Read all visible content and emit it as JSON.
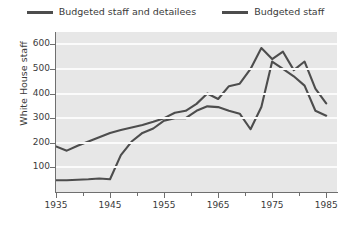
{
  "chart_data": {
    "type": "line",
    "title": "",
    "xlabel": "",
    "ylabel": "White House staff",
    "xlim": [
      1935,
      1987
    ],
    "ylim": [
      0,
      650
    ],
    "grid": true,
    "legend_position": "top-center",
    "x_ticks": [
      1935,
      1945,
      1955,
      1965,
      1975,
      1985
    ],
    "x_ticks_minor": [
      1940,
      1950,
      1960,
      1970,
      1980
    ],
    "y_ticks": [
      100,
      200,
      300,
      400,
      500,
      600
    ],
    "series": [
      {
        "name": "Budgeted staff and detailees",
        "color": "#4d4d4d",
        "x": [
          1935,
          1937,
          1939,
          1941,
          1943,
          1945,
          1947,
          1949,
          1951,
          1953,
          1955,
          1957,
          1959,
          1961,
          1963,
          1965,
          1967,
          1969,
          1971,
          1973,
          1975,
          1977,
          1979,
          1981,
          1983,
          1985
        ],
        "values": [
          185,
          168,
          188,
          205,
          222,
          240,
          252,
          262,
          272,
          285,
          300,
          322,
          330,
          358,
          400,
          378,
          430,
          440,
          500,
          585,
          540,
          570,
          495,
          530,
          420,
          360
        ]
      },
      {
        "name": "Budgeted staff",
        "color": "#4d4d4d",
        "x": [
          1935,
          1937,
          1939,
          1941,
          1943,
          1945,
          1947,
          1949,
          1951,
          1953,
          1955,
          1957,
          1959,
          1961,
          1963,
          1965,
          1967,
          1969,
          1971,
          1973,
          1975,
          1977,
          1979,
          1981,
          1983,
          1985
        ],
        "values": [
          48,
          48,
          50,
          52,
          55,
          52,
          150,
          205,
          240,
          258,
          290,
          300,
          300,
          330,
          348,
          345,
          330,
          318,
          255,
          345,
          530,
          500,
          470,
          432,
          330,
          310
        ]
      }
    ]
  },
  "legend": {
    "items": [
      {
        "label": "Budgeted staff and detailees"
      },
      {
        "label": "Budgeted staff"
      }
    ]
  },
  "axes": {
    "y_title": "White House staff",
    "y_tick_labels": [
      "600",
      "500",
      "400",
      "300",
      "200",
      "100"
    ],
    "x_tick_labels": [
      "1935",
      "1945",
      "1955",
      "1965",
      "1975",
      "1985"
    ]
  }
}
